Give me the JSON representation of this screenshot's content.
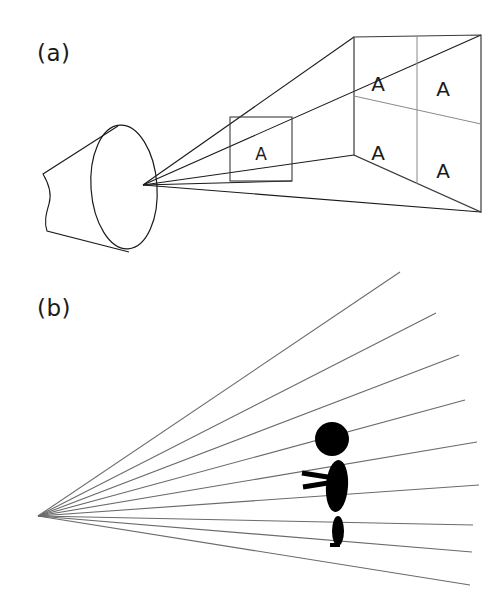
{
  "figure": {
    "background_color": "#ffffff",
    "ink_color": "#1a1a1a",
    "ray_color": "#5a5a5a",
    "width": 504,
    "height": 603
  },
  "panels": [
    {
      "id": "a",
      "label": "(a)",
      "description": "Eye viewing near plane and far plane through a projection cone",
      "near_plane": {
        "letters": [
          "A"
        ],
        "rows": 1,
        "cols": 1
      },
      "far_plane": {
        "letters": [
          "A",
          "A",
          "A",
          "A"
        ],
        "rows": 2,
        "cols": 2
      }
    },
    {
      "id": "b",
      "label": "(b)",
      "description": "Radiating perspective lines converging at a vanishing point with a silhouetted walking figure",
      "ray_count": 9
    }
  ],
  "panel_a": {
    "label": "(a)",
    "letters": {
      "near": "A",
      "far_top_left": "A",
      "far_top_right": "A",
      "far_bottom_left": "A",
      "far_bottom_right": "A"
    }
  },
  "panel_b": {
    "label": "(b)",
    "vanishing_point": {
      "x": 38,
      "y": 256
    },
    "rays": [
      {
        "x2": 400,
        "y2": 12
      },
      {
        "x2": 436,
        "y2": 53
      },
      {
        "x2": 459,
        "y2": 95
      },
      {
        "x2": 465,
        "y2": 140
      },
      {
        "x2": 477,
        "y2": 182
      },
      {
        "x2": 479,
        "y2": 225
      },
      {
        "x2": 473,
        "y2": 265
      },
      {
        "x2": 472,
        "y2": 292
      },
      {
        "x2": 470,
        "y2": 325
      }
    ],
    "figure_silhouette": {
      "head": {
        "cx": 332,
        "cy": 179,
        "r": 17
      },
      "torso": {
        "cx": 337,
        "cy": 226,
        "rx": 11,
        "ry": 26
      },
      "arm_upper": {
        "x1": 302,
        "y1": 213,
        "x2": 334,
        "y2": 218
      },
      "arm_lower": {
        "x1": 303,
        "y1": 227,
        "x2": 334,
        "y2": 222
      },
      "leg": {
        "cx": 338,
        "cy": 271,
        "rx": 6,
        "ry": 15
      },
      "foot": {
        "x1": 330,
        "y1": 285,
        "x2": 340,
        "y2": 285
      }
    }
  }
}
